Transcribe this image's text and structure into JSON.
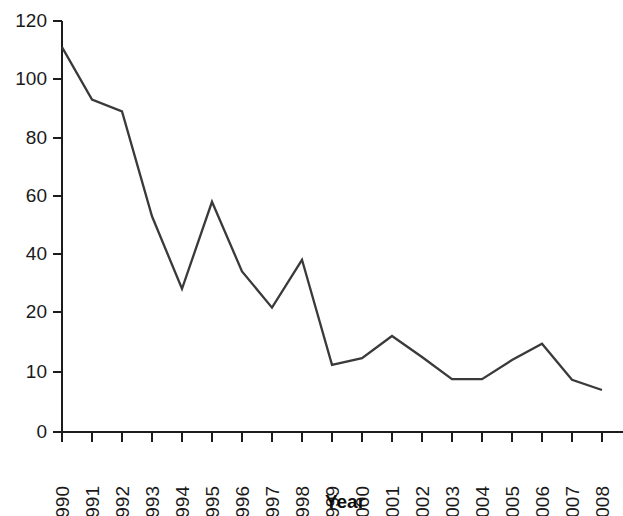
{
  "chart_data": {
    "type": "line",
    "title": "",
    "xlabel": "Year",
    "ylabel": "",
    "grid": false,
    "legend": null,
    "x": [
      "1990",
      "1991",
      "1992",
      "1993",
      "1994",
      "1995",
      "1996",
      "1997",
      "1998",
      "1999",
      "2000",
      "2001",
      "2002",
      "2003",
      "2004",
      "2005",
      "2006",
      "2007",
      "2008"
    ],
    "categories": [
      "1990",
      "1991",
      "1992",
      "1993",
      "1994",
      "1995",
      "1996",
      "1997",
      "1998",
      "1999",
      "2000",
      "2001",
      "2002",
      "2003",
      "2004",
      "2005",
      "2006",
      "2007",
      "2008"
    ],
    "values": [
      111,
      93,
      89,
      53,
      28,
      58,
      34,
      21.5,
      38,
      11.2,
      12.3,
      16,
      12.5,
      8.8,
      8.8,
      12,
      14.7,
      8.7,
      7
    ],
    "series": [
      {
        "name": "",
        "values": [
          111,
          93,
          89,
          53,
          28,
          58,
          34,
          21.5,
          38,
          11.2,
          12.3,
          16,
          12.5,
          8.8,
          8.8,
          12,
          14.7,
          8.7,
          7
        ]
      }
    ],
    "ylim": [
      0,
      120
    ],
    "yticks": [
      0,
      10,
      20,
      40,
      60,
      80,
      100,
      120
    ],
    "ytick_labels": [
      "0",
      "10",
      "20",
      "40",
      "60",
      "80",
      "100",
      "120"
    ],
    "xtick_labels": [
      "1990",
      "1991",
      "1992",
      "1993",
      "1994",
      "1995",
      "1996",
      "1997",
      "1998",
      "1999",
      "2000",
      "2001",
      "2002",
      "2003",
      "2004",
      "2005",
      "2006",
      "2007",
      "2008"
    ],
    "axis_note": "y-axis uses an expanded scale below 20",
    "line_color": "#3a3a3a",
    "axis_color": "#1c1c1c"
  },
  "axes": {
    "x_title": "Year"
  }
}
